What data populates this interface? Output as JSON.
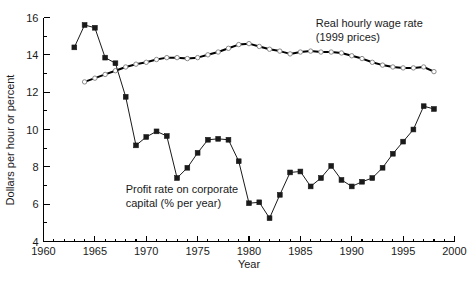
{
  "chart_data": {
    "type": "line",
    "title": "",
    "xlabel": "Year",
    "ylabel": "Dollars per hour or percent",
    "xlim": [
      1960,
      2000
    ],
    "ylim": [
      4,
      16
    ],
    "xticks": [
      1960,
      1965,
      1970,
      1975,
      1980,
      1985,
      1990,
      1995,
      2000
    ],
    "xtick_labels": [
      "1960",
      "1965",
      "1970",
      "1975",
      "1980",
      "1985",
      "1990",
      "1995",
      "2000"
    ],
    "xticks_minor": [
      1961,
      1962,
      1963,
      1964,
      1966,
      1967,
      1968,
      1969,
      1971,
      1972,
      1973,
      1974,
      1976,
      1977,
      1978,
      1979,
      1981,
      1982,
      1983,
      1984,
      1986,
      1987,
      1988,
      1989,
      1991,
      1992,
      1993,
      1994,
      1996,
      1997,
      1998,
      1999
    ],
    "yticks": [
      4,
      6,
      8,
      10,
      12,
      14,
      16
    ],
    "ytick_labels": [
      "4",
      "6",
      "8",
      "10",
      "12",
      "14",
      "16"
    ],
    "yticks_minor": [
      5,
      7,
      9,
      11,
      13,
      15
    ],
    "grid": false,
    "legend_position": "inline-annotations",
    "annotations": [
      {
        "name": "wage-annotation",
        "lines": [
          "Real hourly wage rate",
          "(1999 prices)"
        ],
        "x": 1986.5,
        "y": 15.5
      },
      {
        "name": "profit-annotation",
        "lines": [
          "Profit rate on corporate",
          "capital (% per year)"
        ],
        "x": 1968.0,
        "y": 6.6
      }
    ],
    "series": [
      {
        "name": "Real hourly wage rate (1999 prices)",
        "marker": "open-circle",
        "color": "#000000",
        "x": [
          1964,
          1965,
          1966,
          1967,
          1968,
          1969,
          1970,
          1971,
          1972,
          1973,
          1974,
          1975,
          1976,
          1977,
          1978,
          1979,
          1980,
          1981,
          1982,
          1983,
          1984,
          1985,
          1986,
          1987,
          1988,
          1989,
          1990,
          1991,
          1992,
          1993,
          1994,
          1995,
          1996,
          1997,
          1998
        ],
        "values": [
          12.55,
          12.75,
          12.95,
          13.15,
          13.35,
          13.5,
          13.6,
          13.75,
          13.85,
          13.85,
          13.8,
          13.85,
          14.0,
          14.15,
          14.35,
          14.55,
          14.6,
          14.45,
          14.3,
          14.2,
          14.05,
          14.15,
          14.2,
          14.15,
          14.15,
          14.1,
          13.95,
          13.8,
          13.6,
          13.45,
          13.35,
          13.3,
          13.3,
          13.35,
          13.1
        ]
      },
      {
        "name": "Profit rate on corporate capital (% per year)",
        "marker": "filled-square",
        "color": "#1a1a1a",
        "x": [
          1963,
          1964,
          1965,
          1966,
          1967,
          1968,
          1969,
          1970,
          1971,
          1972,
          1973,
          1974,
          1975,
          1976,
          1977,
          1978,
          1979,
          1980,
          1981,
          1982,
          1983,
          1984,
          1985,
          1986,
          1987,
          1988,
          1989,
          1990,
          1991,
          1992,
          1993,
          1994,
          1995,
          1996,
          1997,
          1998
        ],
        "values": [
          14.4,
          15.6,
          15.45,
          13.85,
          13.55,
          11.75,
          9.15,
          9.6,
          9.9,
          9.65,
          7.4,
          7.95,
          8.75,
          9.45,
          9.5,
          9.45,
          8.3,
          6.05,
          6.1,
          5.25,
          6.5,
          7.7,
          7.75,
          6.95,
          7.4,
          8.05,
          7.3,
          6.95,
          7.2,
          7.4,
          7.95,
          8.7,
          9.35,
          10.0,
          11.25,
          11.1
        ]
      }
    ]
  }
}
